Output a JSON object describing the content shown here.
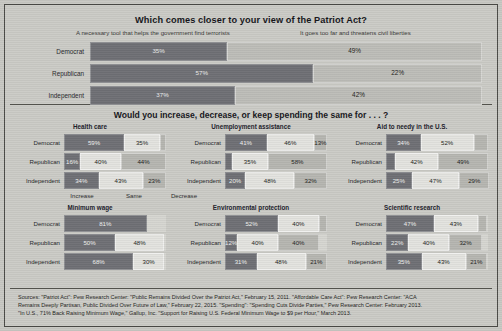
{
  "chart_data": [
    {
      "type": "bar",
      "title": "Which comes closer to your view of the Patriot Act?",
      "orientation": "horizontal-stacked",
      "categories": [
        "Democrat",
        "Republican",
        "Independent"
      ],
      "legend": [
        "A necessary tool that helps the government find terrorists",
        "It goes too far and threatens civil liberties"
      ],
      "series": [
        {
          "name": "A necessary tool that helps the government find terrorists",
          "values": [
            35,
            57,
            37
          ]
        },
        {
          "name": "It goes too far and threatens civil liberties",
          "values": [
            49,
            22,
            42
          ]
        }
      ],
      "xlabel": "",
      "ylabel": "",
      "grid": false,
      "legend_position": "top"
    },
    {
      "type": "bar",
      "title": "Would you increase, decrease, or keep spending the same for . . . ?",
      "orientation": "horizontal-stacked",
      "categories": [
        "Democrat",
        "Republican",
        "Independent"
      ],
      "legend": [
        "Increase",
        "Same",
        "Decrease"
      ],
      "panels": [
        {
          "name": "Health care",
          "rows": [
            {
              "category": "Democrat",
              "increase": 59,
              "same": 35,
              "decrease": 6
            },
            {
              "category": "Republican",
              "increase": 16,
              "same": 40,
              "decrease": 44
            },
            {
              "category": "Independent",
              "increase": 34,
              "same": 43,
              "decrease": 23
            }
          ]
        },
        {
          "name": "Unemployment assistance",
          "rows": [
            {
              "category": "Democrat",
              "increase": 41,
              "same": 46,
              "decrease": 13
            },
            {
              "category": "Republican",
              "increase": 7,
              "same": 35,
              "decrease": 58
            },
            {
              "category": "Independent",
              "increase": 20,
              "same": 48,
              "decrease": 32
            }
          ]
        },
        {
          "name": "Aid to needy in the U.S.",
          "rows": [
            {
              "category": "Democrat",
              "increase": 34,
              "same": 52,
              "decrease": 14
            },
            {
              "category": "Republican",
              "increase": 9,
              "same": 42,
              "decrease": 49
            },
            {
              "category": "Independent",
              "increase": 25,
              "same": 47,
              "decrease": 29
            }
          ]
        },
        {
          "name": "Minimum wage",
          "rows": [
            {
              "category": "Democrat",
              "increase": 81,
              "same": 0,
              "decrease": 0
            },
            {
              "category": "Republican",
              "increase": 50,
              "same": 48,
              "decrease": 0
            },
            {
              "category": "Independent",
              "increase": 68,
              "same": 30,
              "decrease": 0
            }
          ]
        },
        {
          "name": "Environmental protection",
          "rows": [
            {
              "category": "Democrat",
              "increase": 52,
              "same": 40,
              "decrease": 8
            },
            {
              "category": "Republican",
              "increase": 12,
              "same": 40,
              "decrease": 40
            },
            {
              "category": "Independent",
              "increase": 31,
              "same": 48,
              "decrease": 21
            }
          ]
        },
        {
          "name": "Scientific research",
          "rows": [
            {
              "category": "Democrat",
              "increase": 47,
              "same": 43,
              "decrease": 9
            },
            {
              "category": "Republican",
              "increase": 22,
              "same": 40,
              "decrease": 32
            },
            {
              "category": "Independent",
              "increase": 35,
              "same": 43,
              "decrease": 21
            }
          ]
        }
      ]
    }
  ],
  "patriot": {
    "title": "Which comes closer to your view of the Patriot Act?",
    "legend_left": "A necessary tool that helps the government find terrorists",
    "legend_right": "It goes too far and threatens civil liberties",
    "rows": [
      {
        "label": "Democrat",
        "left": 35,
        "right": 49,
        "left_text": "35%",
        "right_text": "49%"
      },
      {
        "label": "Republican",
        "left": 57,
        "right": 22,
        "left_text": "57%",
        "right_text": "22%"
      },
      {
        "label": "Independent",
        "left": 37,
        "right": 42,
        "left_text": "37%",
        "right_text": "42%"
      }
    ]
  },
  "spending": {
    "title": "Would you increase, decrease, or keep spending the same for . . . ?",
    "legend": {
      "increase": "Increase",
      "same": "Same",
      "decrease": "Decrease"
    },
    "panels": [
      {
        "heading": "Health care",
        "rows": [
          {
            "label": "Democrat",
            "inc": 59,
            "same": 35,
            "dec": 6,
            "inc_text": "59%",
            "same_text": "35%",
            "dec_text": ""
          },
          {
            "label": "Republican",
            "inc": 16,
            "same": 40,
            "dec": 44,
            "inc_text": "16%",
            "same_text": "40%",
            "dec_text": "44%"
          },
          {
            "label": "Independent",
            "inc": 34,
            "same": 43,
            "dec": 23,
            "inc_text": "34%",
            "same_text": "43%",
            "dec_text": "23%"
          }
        ]
      },
      {
        "heading": "Unemployment assistance",
        "rows": [
          {
            "label": "Democrat",
            "inc": 41,
            "same": 46,
            "dec": 13,
            "inc_text": "41%",
            "same_text": "46%",
            "dec_text": "13%"
          },
          {
            "label": "Republican",
            "inc": 7,
            "same": 35,
            "dec": 58,
            "inc_text": "",
            "same_text": "35%",
            "dec_text": "58%"
          },
          {
            "label": "Independent",
            "inc": 20,
            "same": 48,
            "dec": 32,
            "inc_text": "20%",
            "same_text": "48%",
            "dec_text": "32%"
          }
        ]
      },
      {
        "heading": "Aid to needy in the U.S.",
        "rows": [
          {
            "label": "Democrat",
            "inc": 34,
            "same": 52,
            "dec": 14,
            "inc_text": "34%",
            "same_text": "52%",
            "dec_text": ""
          },
          {
            "label": "Republican",
            "inc": 9,
            "same": 42,
            "dec": 49,
            "inc_text": "",
            "same_text": "42%",
            "dec_text": "49%"
          },
          {
            "label": "Independent",
            "inc": 25,
            "same": 47,
            "dec": 29,
            "inc_text": "25%",
            "same_text": "47%",
            "dec_text": "29%"
          }
        ]
      },
      {
        "heading": "Minimum wage",
        "rows": [
          {
            "label": "Democrat",
            "inc": 81,
            "same": 0,
            "dec": 0,
            "inc_text": "81%",
            "same_text": "",
            "dec_text": ""
          },
          {
            "label": "Republican",
            "inc": 50,
            "same": 48,
            "dec": 0,
            "inc_text": "50%",
            "same_text": "48%",
            "dec_text": ""
          },
          {
            "label": "Independent",
            "inc": 68,
            "same": 30,
            "dec": 0,
            "inc_text": "68%",
            "same_text": "30%",
            "dec_text": ""
          }
        ]
      },
      {
        "heading": "Environmental protection",
        "rows": [
          {
            "label": "Democrat",
            "inc": 52,
            "same": 40,
            "dec": 8,
            "inc_text": "52%",
            "same_text": "40%",
            "dec_text": ""
          },
          {
            "label": "Republican",
            "inc": 12,
            "same": 40,
            "dec": 40,
            "inc_text": "12%",
            "same_text": "40%",
            "dec_text": "40%"
          },
          {
            "label": "Independent",
            "inc": 31,
            "same": 48,
            "dec": 21,
            "inc_text": "31%",
            "same_text": "48%",
            "dec_text": "21%"
          }
        ]
      },
      {
        "heading": "Scientific research",
        "rows": [
          {
            "label": "Democrat",
            "inc": 47,
            "same": 43,
            "dec": 9,
            "inc_text": "47%",
            "same_text": "43%",
            "dec_text": ""
          },
          {
            "label": "Republican",
            "inc": 22,
            "same": 40,
            "dec": 32,
            "inc_text": "22%",
            "same_text": "40%",
            "dec_text": "32%"
          },
          {
            "label": "Independent",
            "inc": 35,
            "same": 43,
            "dec": 21,
            "inc_text": "35%",
            "same_text": "43%",
            "dec_text": "21%"
          }
        ]
      }
    ]
  },
  "sources": {
    "line1": "Sources: \"Patriot Act\": Pew Research Center: \"Public Remains Divided Over the Patriot Act,\" February 15, 2011. \"Affordable Care Act\": Pew Research Center: \"ACA",
    "line2": "Remains Deeply Partisan, Public Divided Over Future of Law,\" February 22, 2015. \"Spending\": \"Spending Cuts Divide Parties,\" Pew Research Center: February 2013.",
    "line3": "\"In U.S., 71% Back Raising Minimum Wage,\" Gallup, Inc. \"Support for Raising U.S. Federal Minimum Wage to $9 per Hour,\" March 2013."
  }
}
